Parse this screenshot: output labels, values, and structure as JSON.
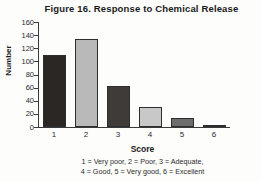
{
  "chart_data": {
    "type": "bar",
    "title": "Figure 16. Response to Chemical Release",
    "xlabel": "Score",
    "ylabel": "Number",
    "categories": [
      "1",
      "2",
      "3",
      "4",
      "5",
      "6"
    ],
    "values": [
      110,
      134,
      62,
      31,
      13,
      2
    ],
    "ylim": [
      0,
      160
    ],
    "yticks": [
      0,
      20,
      40,
      60,
      80,
      100,
      120,
      140,
      160
    ],
    "grid": false,
    "legend_position": "below-axis",
    "annotations": [
      "1 = Very poor,  2 = Poor,  3 = Adequate,",
      "4 = Good,  5 = Very good,  6 = Excellent"
    ],
    "bar_fills": [
      "#2a2724",
      "#b9b9b9",
      "#3e3b39",
      "#c8c8c8",
      "#6d6d6d",
      "#9a9a9a"
    ]
  }
}
